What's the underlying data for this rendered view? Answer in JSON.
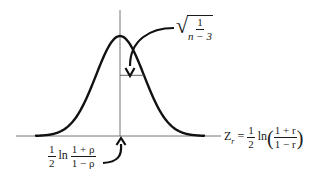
{
  "diagram": {
    "curve": {
      "type": "normal-density",
      "mean": 0,
      "sd": 1,
      "x_range_sd": [
        -3.5,
        3.5
      ]
    },
    "sd_label": {
      "radical": "√",
      "numerator": "1",
      "denominator": "n − 3"
    },
    "x_axis_label": {
      "lhs": "Z",
      "lhs_subscript": "r",
      "equals": "=",
      "coef_num": "1",
      "coef_den": "2",
      "fn": "ln",
      "open": "(",
      "close": ")",
      "frac_num": "1 + r",
      "frac_den": "1 − r"
    },
    "mean_label": {
      "coef_num": "1",
      "coef_den": "2",
      "fn": "ln",
      "frac_num": "1 + ρ",
      "frac_den": "1 − ρ"
    },
    "colors": {
      "curve": "#111111",
      "axis": "#555555",
      "text": "#1a1a1a"
    }
  }
}
